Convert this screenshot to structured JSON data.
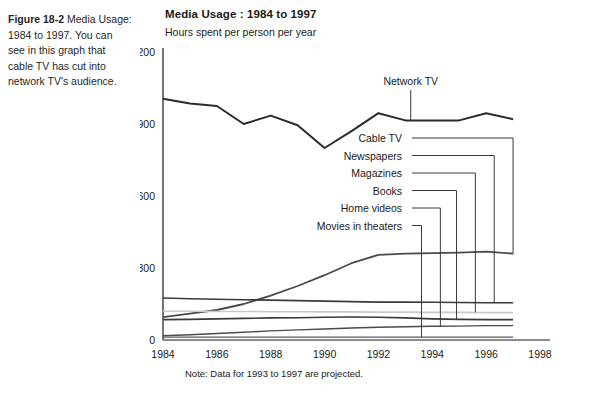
{
  "caption": {
    "figure_label": "Figure 18-2",
    "figure_title": "Media Usage: 1984 to 1997.",
    "body": "You can see in this graph that cable TV has cut into network TV's audience."
  },
  "chart_panel": {
    "title": "Media Usage : 1984 to 1997",
    "subtitle": "Hours spent per person per year",
    "note": "Note: Data for 1993 to 1997 are projected."
  },
  "chart_data": {
    "type": "line",
    "title": "Media Usage : 1984 to 1997",
    "subtitle": "Hours spent per person per year",
    "xlabel": "",
    "ylabel": "Hours spent per person per year",
    "xlim": [
      1984,
      1998
    ],
    "ylim": [
      0,
      1200
    ],
    "yticks": [
      0,
      300,
      600,
      900,
      1200
    ],
    "ytick_labels": [
      "0",
      "300",
      "600",
      "900",
      "1,200"
    ],
    "xticks": [
      1984,
      1986,
      1988,
      1990,
      1992,
      1994,
      1996,
      1998
    ],
    "xtick_labels": [
      "1984",
      "1986",
      "1988",
      "1990",
      "1992",
      "1994",
      "1996",
      "1998"
    ],
    "grid": false,
    "legend_position": "inline-labels",
    "annotation": "Note: Data for 1993 to 1997 are projected.",
    "x": [
      1984,
      1985,
      1986,
      1987,
      1988,
      1989,
      1990,
      1991,
      1992,
      1993,
      1994,
      1995,
      1996,
      1997
    ],
    "series": [
      {
        "name": "Network TV",
        "color": "#2b2b2b",
        "width": 2.0,
        "values": [
          1005,
          985,
          975,
          900,
          935,
          895,
          800,
          870,
          945,
          915,
          915,
          915,
          945,
          920
        ]
      },
      {
        "name": "Cable TV",
        "color": "#4a4a4a",
        "width": 1.8,
        "values": [
          95,
          110,
          125,
          150,
          185,
          225,
          270,
          320,
          355,
          360,
          362,
          364,
          368,
          360
        ]
      },
      {
        "name": "Newspapers",
        "color": "#3a3a3a",
        "width": 1.6,
        "values": [
          175,
          172,
          170,
          168,
          166,
          164,
          162,
          160,
          158,
          158,
          157,
          156,
          155,
          155
        ]
      },
      {
        "name": "Magazines",
        "color": "#c9c9c9",
        "width": 1.6,
        "values": [
          120,
          120,
          119,
          119,
          118,
          118,
          117,
          117,
          116,
          116,
          115,
          115,
          114,
          114
        ]
      },
      {
        "name": "Books",
        "color": "#3a3a3a",
        "width": 1.6,
        "values": [
          85,
          86,
          88,
          90,
          92,
          93,
          95,
          96,
          95,
          92,
          88,
          86,
          85,
          85
        ]
      },
      {
        "name": "Home videos",
        "color": "#4a4a4a",
        "width": 1.4,
        "values": [
          18,
          22,
          27,
          32,
          38,
          42,
          46,
          50,
          53,
          55,
          57,
          58,
          60,
          60
        ]
      },
      {
        "name": "Movies in theaters",
        "color": "#5a5a5a",
        "width": 1.3,
        "values": [
          12,
          12,
          12,
          12,
          12,
          12,
          12,
          12,
          12,
          12,
          12,
          12,
          12,
          12
        ]
      }
    ],
    "callouts": [
      {
        "label": "Network TV",
        "anchor_year": 1993.2,
        "anchor_value": 915
      },
      {
        "label": "Cable TV",
        "anchor_year": 1997.0,
        "anchor_value": 360
      },
      {
        "label": "Newspapers",
        "anchor_year": 1996.3,
        "anchor_value": 155
      },
      {
        "label": "Magazines",
        "anchor_year": 1995.6,
        "anchor_value": 115
      },
      {
        "label": "Books",
        "anchor_year": 1994.9,
        "anchor_value": 86
      },
      {
        "label": "Home videos",
        "anchor_year": 1994.3,
        "anchor_value": 57
      },
      {
        "label": "Movies in theaters",
        "anchor_year": 1993.6,
        "anchor_value": 12
      }
    ]
  }
}
